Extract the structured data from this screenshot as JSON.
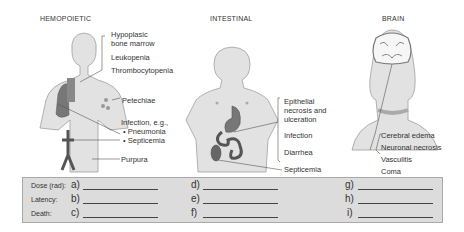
{
  "panels": [
    {
      "title": "HEMOPOIETIC",
      "labels": [
        "Hypoplasic",
        "bone marrow",
        "Leukopenia",
        "Thrombocytopenia",
        "Petechiae",
        "Infection, e.g.,",
        "• Pneumonia",
        "• Septicemia",
        "Purpura"
      ]
    },
    {
      "title": "INTESTINAL",
      "labels": [
        "Epithelial",
        "necrosis and",
        "ulceration",
        "Infection",
        "Diarrhea",
        "Septicemia"
      ]
    },
    {
      "title": "BRAIN",
      "labels": [
        "Cerebral edema",
        "Neuronal necrosis",
        "Vasculitis",
        "Coma"
      ]
    }
  ],
  "answer_box": {
    "row_labels": [
      "Dose (rad):",
      "Latency:",
      "Death:"
    ],
    "letters": [
      "a)",
      "b)",
      "c)",
      "d)",
      "e)",
      "f)",
      "g)",
      "h)",
      "i)"
    ]
  },
  "colors": {
    "skin": "#e2e2e2",
    "skin_outline": "#9a9a9a",
    "organ": "#6a6a6a",
    "box_bg": "#dcdcdc"
  }
}
